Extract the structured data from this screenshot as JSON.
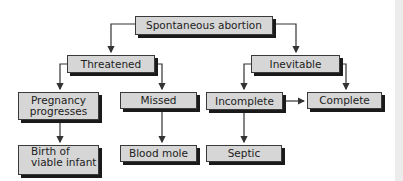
{
  "diagram": {
    "nodes": {
      "root": "Spontaneous abortion",
      "threatened": "Threatened",
      "inevitable": "Inevitable",
      "pregnancy_progresses_1": "Pregnancy",
      "pregnancy_progresses_2": "progresses",
      "missed": "Missed",
      "incomplete": "Incomplete",
      "complete": "Complete",
      "birth_1": "Birth of",
      "birth_2": "viable infant",
      "blood_mole": "Blood mole",
      "septic": "Septic"
    },
    "edges": [
      [
        "Spontaneous abortion",
        "Threatened"
      ],
      [
        "Spontaneous abortion",
        "Inevitable"
      ],
      [
        "Threatened",
        "Pregnancy progresses"
      ],
      [
        "Threatened",
        "Missed"
      ],
      [
        "Inevitable",
        "Incomplete"
      ],
      [
        "Inevitable",
        "Complete"
      ],
      [
        "Incomplete",
        "Complete"
      ],
      [
        "Pregnancy progresses",
        "Birth of viable infant"
      ],
      [
        "Missed",
        "Blood mole"
      ],
      [
        "Incomplete",
        "Septic"
      ]
    ],
    "colors": {
      "box_fill": "#d6d6d6",
      "border": "#3a3a3a",
      "shadow": "#1a1a1a",
      "line": "#333333"
    }
  }
}
